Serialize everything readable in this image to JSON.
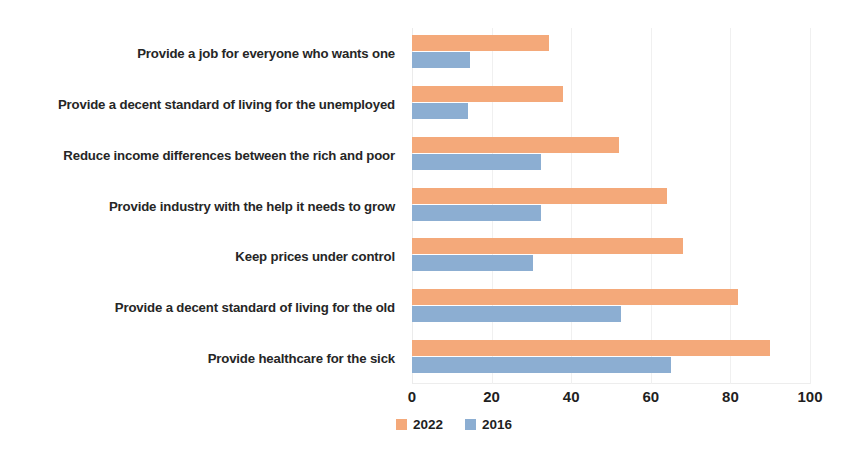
{
  "chart_data": {
    "type": "bar",
    "orientation": "horizontal",
    "title": "",
    "subtitle": "",
    "xlabel": "",
    "ylabel": "",
    "xlim": [
      0,
      100
    ],
    "xticks": [
      0,
      20,
      40,
      60,
      80,
      100
    ],
    "xtick_labels": [
      "0",
      "20",
      "40",
      "60",
      "80",
      "100"
    ],
    "grid": true,
    "grid_axis": "x",
    "legend_position": "bottom",
    "categories": [
      "Provide a job for everyone who wants one",
      "Provide a decent standard of living for the unemployed",
      "Reduce income differences between the rich and poor",
      "Provide industry with the help it needs to grow",
      "Keep prices under control",
      "Provide a decent standard of living for the old",
      "Provide healthcare for the sick"
    ],
    "series": [
      {
        "name": "2022",
        "color": "#f4a97a",
        "values": [
          34.5,
          38,
          52,
          64,
          68,
          82,
          90
        ]
      },
      {
        "name": "2016",
        "color": "#8caed2",
        "values": [
          14.5,
          14,
          32.5,
          32.5,
          30.5,
          52.5,
          65
        ]
      }
    ]
  },
  "legend": {
    "items": [
      {
        "label": "2022",
        "color": "#f4a97a"
      },
      {
        "label": "2016",
        "color": "#8caed2"
      }
    ]
  }
}
